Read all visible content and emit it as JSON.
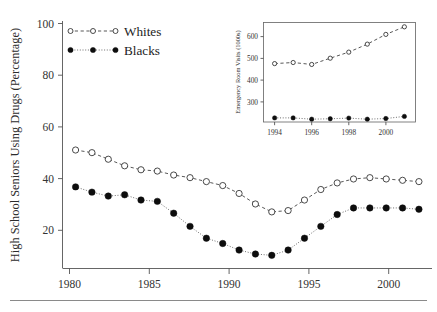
{
  "chart_data": [
    {
      "type": "line",
      "id": "main",
      "title": "",
      "xlabel": "",
      "ylabel": "High School Seniors Using Drugs (Percentage)",
      "xlim": [
        1979.2,
        2001.8
      ],
      "ylim": [
        10,
        104
      ],
      "xticks": [
        1980,
        1985,
        1990,
        1995,
        2000
      ],
      "xtick_labels": [
        "1980",
        "1985",
        "1990",
        "1995",
        "2000"
      ],
      "yticks": [
        20,
        40,
        60,
        80,
        100
      ],
      "ytick_labels": [
        "20",
        "40",
        "60",
        "80",
        "100"
      ],
      "grid": false,
      "legend_position": "top-left",
      "x": [
        1980,
        1981,
        1982,
        1983,
        1984,
        1985,
        1986,
        1987,
        1988,
        1989,
        1990,
        1991,
        1992,
        1993,
        1994,
        1995,
        1996,
        1997,
        1998,
        1999,
        2000,
        2001
      ],
      "series": [
        {
          "name": "Whites",
          "marker": "open-circle",
          "linestyle": "dashed",
          "values": [
            55.0,
            54.0,
            51.5,
            49.0,
            47.5,
            47.0,
            45.5,
            44.5,
            43.0,
            41.5,
            38.5,
            34.5,
            31.5,
            32.0,
            36.0,
            40.0,
            42.5,
            44.0,
            44.5,
            44.0,
            43.5,
            43.0
          ]
        },
        {
          "name": "Blacks",
          "marker": "filled-circle",
          "linestyle": "dotted",
          "values": [
            41.0,
            39.0,
            37.5,
            38.0,
            36.0,
            35.5,
            31.0,
            26.0,
            21.5,
            19.5,
            17.0,
            15.5,
            15.0,
            17.0,
            21.5,
            26.0,
            30.5,
            33.0,
            33.0,
            33.0,
            33.0,
            32.5
          ]
        }
      ]
    },
    {
      "type": "line",
      "id": "inset",
      "title": "",
      "xlabel": "",
      "ylabel": "Emergency Room Visits (1000s)",
      "xlim": [
        1993.4,
        2001.6
      ],
      "ylim": [
        230,
        690
      ],
      "xticks": [
        1994,
        1996,
        1998,
        2000
      ],
      "xtick_labels": [
        "1994",
        "1996",
        "1998",
        "2000"
      ],
      "yticks": [
        300,
        400,
        500,
        600
      ],
      "ytick_labels": [
        "300",
        "400",
        "500",
        "600"
      ],
      "grid": false,
      "legend_position": "none",
      "x": [
        1994,
        1995,
        1996,
        1997,
        1998,
        1999,
        2000,
        2001
      ],
      "series": [
        {
          "name": "Whites",
          "marker": "open-circle",
          "linestyle": "dashed",
          "values": [
            500,
            505,
            496,
            525,
            553,
            590,
            635,
            670
          ]
        },
        {
          "name": "Blacks",
          "marker": "filled-circle",
          "linestyle": "dotted",
          "values": [
            249,
            249,
            243,
            245,
            248,
            243,
            246,
            256
          ]
        }
      ]
    }
  ],
  "main_axis": {
    "ylabel": "High School Seniors Using Drugs (Percentage)",
    "ytick_labels": [
      "100",
      "80",
      "60",
      "40",
      "20"
    ],
    "xtick_labels": [
      "1980",
      "1985",
      "1990",
      "1995",
      "2000"
    ]
  },
  "legend": {
    "entries": [
      {
        "label": "Whites",
        "marker": "open-circle"
      },
      {
        "label": "Blacks",
        "marker": "filled-circle"
      }
    ]
  },
  "inset_axis": {
    "ylabel": "Emergency Room Visits (1000s)",
    "ytick_labels": [
      "600",
      "500",
      "400",
      "300"
    ],
    "xtick_labels": [
      "1994",
      "1996",
      "1998",
      "2000"
    ]
  },
  "colors": {
    "axis": "#555555",
    "text": "#2b2b2b",
    "whites_marker_fill": "#ffffff",
    "whites_marker_stroke": "#2a2a2a",
    "blacks_marker_fill": "#0d0d0d",
    "rule": "#8a8a8a"
  }
}
